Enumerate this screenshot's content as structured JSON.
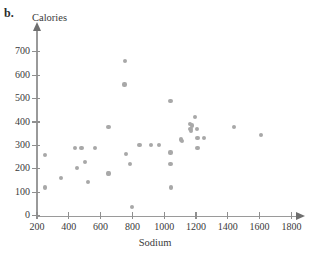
{
  "figure": {
    "label": "b.",
    "top_cut_text": "",
    "marker_color": "#a8a8a8",
    "axis_color": "#9a9a9a"
  },
  "chart_data": {
    "type": "scatter",
    "title": "",
    "xlabel": "Sodium",
    "ylabel": "Calories",
    "xlim": [
      150,
      1850
    ],
    "ylim": [
      0,
      760
    ],
    "grid": false,
    "legend": null,
    "xticks": [
      200,
      400,
      600,
      800,
      1000,
      1200,
      1400,
      1600,
      1800
    ],
    "yticks": [
      0,
      100,
      200,
      300,
      400,
      500,
      600,
      700
    ],
    "xticklabels": [
      "200",
      "400",
      "600",
      "800",
      "1000",
      "1200",
      "1400",
      "1600",
      "1800"
    ],
    "yticklabels": [
      "0",
      "100",
      "200",
      "300",
      "400",
      "500",
      "600",
      "700"
    ],
    "points": [
      {
        "x": 250,
        "y": 260
      },
      {
        "x": 250,
        "y": 120
      },
      {
        "x": 350,
        "y": 160
      },
      {
        "x": 440,
        "y": 290
      },
      {
        "x": 450,
        "y": 205
      },
      {
        "x": 480,
        "y": 290
      },
      {
        "x": 500,
        "y": 230
      },
      {
        "x": 520,
        "y": 145
      },
      {
        "x": 565,
        "y": 290
      },
      {
        "x": 645,
        "y": 180
      },
      {
        "x": 655,
        "y": 180
      },
      {
        "x": 650,
        "y": 380
      },
      {
        "x": 755,
        "y": 660
      },
      {
        "x": 750,
        "y": 560
      },
      {
        "x": 760,
        "y": 263
      },
      {
        "x": 785,
        "y": 222
      },
      {
        "x": 800,
        "y": 35
      },
      {
        "x": 845,
        "y": 300
      },
      {
        "x": 915,
        "y": 303
      },
      {
        "x": 965,
        "y": 303
      },
      {
        "x": 1040,
        "y": 490
      },
      {
        "x": 1040,
        "y": 270
      },
      {
        "x": 1040,
        "y": 222
      },
      {
        "x": 1045,
        "y": 120
      },
      {
        "x": 1105,
        "y": 325
      },
      {
        "x": 1110,
        "y": 318
      },
      {
        "x": 1160,
        "y": 393
      },
      {
        "x": 1165,
        "y": 370
      },
      {
        "x": 1170,
        "y": 360
      },
      {
        "x": 1175,
        "y": 385
      },
      {
        "x": 1195,
        "y": 420
      },
      {
        "x": 1205,
        "y": 370
      },
      {
        "x": 1210,
        "y": 333
      },
      {
        "x": 1210,
        "y": 290
      },
      {
        "x": 1250,
        "y": 332
      },
      {
        "x": 1440,
        "y": 380
      },
      {
        "x": 1610,
        "y": 343
      }
    ]
  }
}
